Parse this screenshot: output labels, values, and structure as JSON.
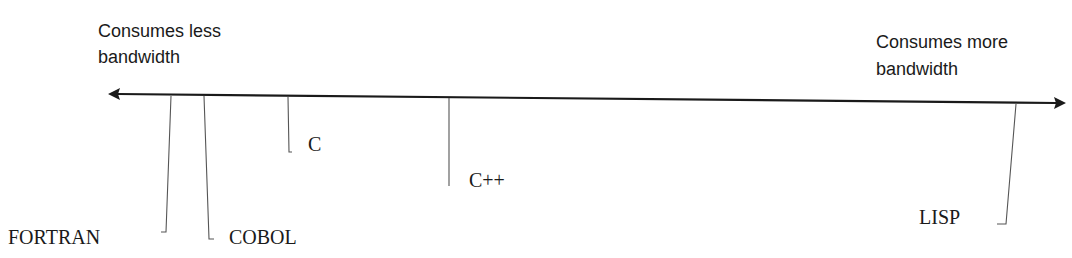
{
  "diagram": {
    "type": "spectrum-axis",
    "axis": {
      "left_label_line1": "Consumes less",
      "left_label_line2": "bandwidth",
      "right_label_line1": "Consumes more",
      "right_label_line2": "bandwidth",
      "direction": "bidirectional"
    },
    "items": [
      {
        "label": "FORTRAN",
        "order": 1
      },
      {
        "label": "COBOL",
        "order": 2
      },
      {
        "label": "C",
        "order": 3
      },
      {
        "label": "C++",
        "order": 4
      },
      {
        "label": "LISP",
        "order": 5
      }
    ],
    "colors": {
      "line": "#1a1a1a",
      "leader": "#555555",
      "text": "#1a1a1a",
      "background": "#ffffff"
    }
  }
}
